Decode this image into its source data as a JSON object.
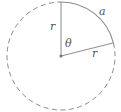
{
  "diagram": {
    "type": "circle-sector",
    "circle": {
      "cx": 61,
      "cy": 56,
      "r": 54,
      "style": "dashed"
    },
    "arc": {
      "label": "a",
      "style": "solid",
      "from_deg": 90,
      "to_deg": 14
    },
    "radii": [
      {
        "label": "r",
        "angle_deg": 90
      },
      {
        "label": "r",
        "angle_deg": 14
      }
    ],
    "angle": {
      "label": "θ"
    },
    "colors": {
      "line": "#8a8a8a",
      "text": "#555555",
      "center_dot": "#777777"
    }
  }
}
